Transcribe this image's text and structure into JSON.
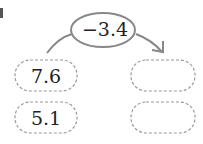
{
  "diagram": {
    "operator": "−3.4",
    "inputs": [
      "7.6",
      "5.1"
    ],
    "outputs": [
      "",
      ""
    ],
    "colors": {
      "stroke": "#888888",
      "text": "#222222"
    }
  }
}
